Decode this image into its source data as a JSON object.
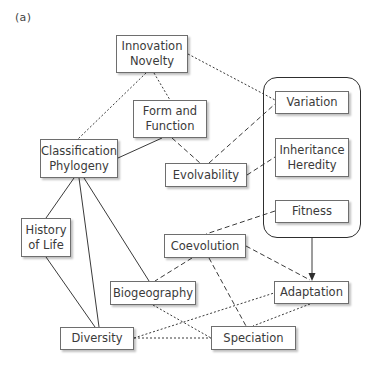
{
  "panel_label": "(a)",
  "container": {
    "name": "heritable-variation-group",
    "members": [
      "variation",
      "inheritance",
      "fitness"
    ]
  },
  "nodes": {
    "innovation": {
      "line1": "Innovation",
      "line2": "Novelty"
    },
    "form_function": {
      "line1": "Form and",
      "line2": "Function"
    },
    "classification": {
      "line1": "Classification",
      "line2": "Phylogeny"
    },
    "evolvability": {
      "line1": "Evolvability"
    },
    "variation": {
      "line1": "Variation"
    },
    "inheritance": {
      "line1": "Inheritance",
      "line2": "Heredity"
    },
    "fitness": {
      "line1": "Fitness"
    },
    "history": {
      "line1": "History",
      "line2": "of Life"
    },
    "coevolution": {
      "line1": "Coevolution"
    },
    "biogeography": {
      "line1": "Biogeography"
    },
    "adaptation": {
      "line1": "Adaptation"
    },
    "diversity": {
      "line1": "Diversity"
    },
    "speciation": {
      "line1": "Speciation"
    }
  },
  "edges": [
    {
      "from": "classification",
      "to": "form_function",
      "style": "solid"
    },
    {
      "from": "classification",
      "to": "history",
      "style": "solid"
    },
    {
      "from": "classification",
      "to": "diversity",
      "style": "solid"
    },
    {
      "from": "classification",
      "to": "biogeography",
      "style": "solid"
    },
    {
      "from": "history",
      "to": "diversity",
      "style": "solid"
    },
    {
      "from": "container",
      "to": "adaptation",
      "style": "solid-arrow"
    },
    {
      "from": "form_function",
      "to": "evolvability",
      "style": "dashed"
    },
    {
      "from": "evolvability",
      "to": "variation",
      "style": "dashed"
    },
    {
      "from": "evolvability",
      "to": "inheritance",
      "style": "dashed"
    },
    {
      "from": "fitness",
      "to": "coevolution",
      "style": "dashed"
    },
    {
      "from": "coevolution",
      "to": "biogeography",
      "style": "dashed"
    },
    {
      "from": "coevolution",
      "to": "adaptation",
      "style": "dashed"
    },
    {
      "from": "coevolution",
      "to": "speciation",
      "style": "dashed"
    },
    {
      "from": "innovation",
      "to": "form_function",
      "style": "dotted"
    },
    {
      "from": "innovation",
      "to": "classification",
      "style": "dotted"
    },
    {
      "from": "innovation",
      "to": "variation",
      "style": "dotted"
    },
    {
      "from": "biogeography",
      "to": "speciation",
      "style": "dotted"
    },
    {
      "from": "diversity",
      "to": "adaptation",
      "style": "dotted"
    },
    {
      "from": "diversity",
      "to": "speciation",
      "style": "dotted"
    },
    {
      "from": "adaptation",
      "to": "speciation",
      "style": "dotted"
    }
  ],
  "colors": {
    "line": "#3a3a3a",
    "box_border": "#6e6e6e",
    "text": "#3a3a3a",
    "background": "#ffffff"
  }
}
